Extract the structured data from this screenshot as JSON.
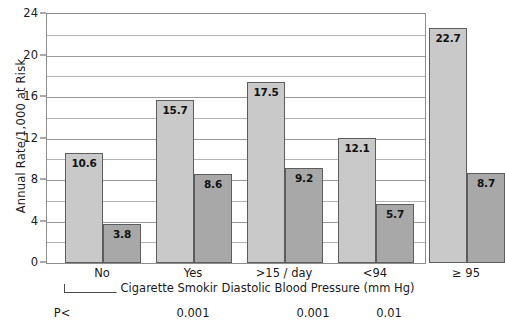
{
  "chart_data": {
    "type": "bar",
    "title": "",
    "xlabel": "",
    "ylabel": "Annual Rate/1,000 at Risk",
    "ylim": [
      0,
      24
    ],
    "ytick_labels": [
      "0",
      "4",
      "8",
      "12",
      "16",
      "20",
      "24"
    ],
    "ytick_values": [
      0,
      4,
      8,
      12,
      16,
      20,
      24
    ],
    "gridline_values": [
      0,
      2,
      4,
      6,
      8,
      10,
      12,
      14,
      16,
      18,
      20,
      22,
      24
    ],
    "grid": true,
    "legend_position": "none",
    "categories": [
      "No",
      "Yes",
      ">15 / day",
      "<94",
      "≥ 95"
    ],
    "series": [
      {
        "name": "light",
        "color": "#c9c9c9",
        "values": [
          10.6,
          15.7,
          17.5,
          12.1,
          22.7
        ]
      },
      {
        "name": "dark",
        "color": "#a8a8a8",
        "values": [
          3.8,
          8.6,
          9.2,
          5.7,
          8.7
        ]
      }
    ],
    "value_labels": [
      "10.6",
      "3.8",
      "15.7",
      "8.6",
      "17.5",
      "9.2",
      "12.1",
      "5.7",
      "22.7",
      "8.7"
    ],
    "groups": [
      {
        "title": "Cigarette Smoking",
        "categories": [
          "No",
          "Yes",
          ">15 / day"
        ],
        "bracket": true
      },
      {
        "title": "Diastolic Blood Pressure (mm Hg)",
        "categories": [
          "<94",
          "≥ 95"
        ],
        "bracket": false
      }
    ],
    "annotations": {
      "p_row_label": "P<",
      "p_values": [
        {
          "text": "0.001",
          "under": "Yes"
        },
        {
          "text": "0.001",
          "under": "<94"
        },
        {
          "text": "0.01",
          "under": "≥ 95"
        }
      ]
    }
  },
  "axis": {
    "y_title": "Annual Rate/1,000 at Risk",
    "ticks": [
      "24",
      "20",
      "16",
      "12",
      "8",
      "4",
      "0"
    ]
  },
  "categories": {
    "c0": "No",
    "c1": "Yes",
    "c2": ">15 / day",
    "c3": "<94",
    "c4": "≥ 95"
  },
  "values": {
    "v0l": "10.6",
    "v0d": "3.8",
    "v1l": "15.7",
    "v1d": "8.6",
    "v2l": "17.5",
    "v2d": "9.2",
    "v3l": "12.1",
    "v3d": "5.7",
    "v4l": "22.7",
    "v4d": "8.7"
  },
  "groups": {
    "g0_title": "Cigarette Smoking",
    "g1_title": "Diastolic Blood Pressure (mm Hg)"
  },
  "pvalues": {
    "label": "P<",
    "p0": "0.001",
    "p1": "0.001",
    "p2": "0.01"
  }
}
